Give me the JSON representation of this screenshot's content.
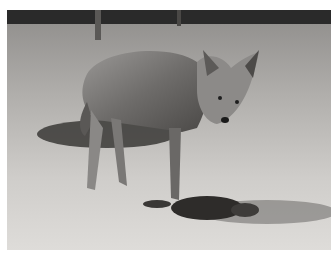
{
  "image": {
    "subject": "coyote",
    "description": "Black-and-white photograph of a coyote standing on a dirt ground, looking toward the camera, with a dark lump of prey remains on the ground near its front paws and a dark tree line in the background.",
    "colors": {
      "border": "#ffffff",
      "ground": "#b8b6b2",
      "ground_light": "#d8d6d2",
      "treeline": "#2a2a2a",
      "fur": "#7a7876",
      "fur_dark": "#3e3c3a",
      "shadow": "#4a4846"
    }
  }
}
